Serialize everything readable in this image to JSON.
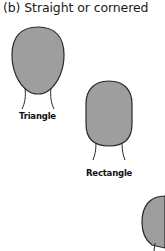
{
  "title": "(b)  Straight or cornered",
  "shapes": [
    {
      "name": "Triangle",
      "fill": "#9e9e9e",
      "stroke": "#2a2a2a"
    },
    {
      "name": "Rectangle",
      "fill": "#9e9e9e",
      "stroke": "#2a2a2a"
    },
    {
      "name": "",
      "fill": "#9e9e9e",
      "stroke": "#2a2a2a"
    }
  ]
}
